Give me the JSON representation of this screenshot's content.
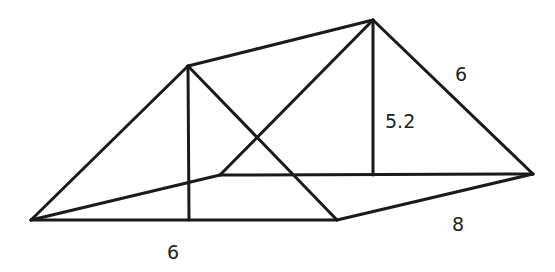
{
  "diagram": {
    "type": "triangular-prism",
    "stroke_color": "#1a1a1a",
    "vertices": {
      "A": [
        31,
        220
      ],
      "B": [
        188,
        66
      ],
      "C": [
        373,
        20
      ],
      "D": [
        533,
        174
      ],
      "E": [
        337,
        220
      ],
      "F": [
        220,
        175
      ],
      "H1": [
        189,
        220
      ],
      "H2": [
        373,
        175
      ]
    },
    "edges": [
      [
        "A",
        "B"
      ],
      [
        "B",
        "E"
      ],
      [
        "A",
        "E"
      ],
      [
        "B",
        "C"
      ],
      [
        "E",
        "D"
      ],
      [
        "A",
        "F"
      ],
      [
        "F",
        "C"
      ],
      [
        "C",
        "D"
      ],
      [
        "F",
        "D"
      ],
      [
        "B",
        "H1"
      ],
      [
        "C",
        "H2"
      ]
    ],
    "labels": {
      "front_base": "6",
      "height": "5.2",
      "slant_side": "6",
      "length": "8"
    }
  }
}
